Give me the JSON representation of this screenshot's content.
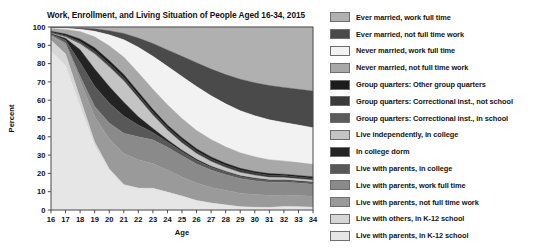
{
  "chart_data": {
    "type": "area",
    "title": "Work, Enrollment, and Living Situation of People Aged 16-34, 2015",
    "xlabel": "Age",
    "ylabel": "Percent",
    "xlim": [
      16,
      34
    ],
    "ylim": [
      0,
      100
    ],
    "grid": false,
    "legend_position": "right",
    "stacked": true,
    "stack_order": "top-to-bottom",
    "categories": [
      16,
      17,
      18,
      19,
      20,
      21,
      22,
      23,
      24,
      25,
      26,
      27,
      28,
      29,
      30,
      31,
      32,
      33,
      34
    ],
    "x_tick_labels": [
      "16",
      "17",
      "18",
      "19",
      "20",
      "21",
      "22",
      "23",
      "24",
      "25",
      "26",
      "27",
      "28",
      "29",
      "30",
      "31",
      "32",
      "33",
      "34"
    ],
    "y_tick_labels": [
      "0",
      "10",
      "20",
      "30",
      "40",
      "50",
      "60",
      "70",
      "80",
      "90",
      "100"
    ],
    "series": [
      {
        "name": "Ever married, work full time",
        "color": "#b0b0b0",
        "values": [
          0.2,
          0.3,
          0.5,
          1.0,
          2.0,
          3.5,
          6.0,
          9.0,
          12.5,
          16.0,
          19.5,
          23.0,
          26.0,
          28.5,
          30.5,
          32.0,
          33.0,
          34.0,
          35.0
        ]
      },
      {
        "name": "Ever married, not full time work",
        "color": "#4a4a4a",
        "values": [
          0.3,
          0.4,
          0.7,
          1.3,
          2.3,
          3.4,
          5.0,
          7.0,
          9.0,
          11.0,
          13.0,
          14.5,
          16.0,
          17.2,
          18.0,
          18.7,
          19.2,
          19.6,
          20.0
        ]
      },
      {
        "name": "Never married, work full time",
        "color": "#f2f2f2",
        "values": [
          0.3,
          0.6,
          1.3,
          3.0,
          6.0,
          9.5,
          14.0,
          18.0,
          21.0,
          23.0,
          24.0,
          24.0,
          23.5,
          23.0,
          22.5,
          21.8,
          21.0,
          20.5,
          20.0
        ]
      },
      {
        "name": "Never married, not full time work",
        "color": "#a8a8a8",
        "values": [
          1.5,
          2.5,
          4.0,
          6.0,
          8.0,
          9.5,
          10.5,
          11.0,
          11.0,
          10.5,
          10.0,
          9.5,
          9.0,
          8.5,
          8.0,
          7.6,
          7.2,
          7.0,
          6.8
        ]
      },
      {
        "name": "Group quarters: Other group quarters",
        "color": "#1c1c1c",
        "values": [
          0.5,
          0.8,
          1.4,
          1.8,
          1.8,
          1.7,
          1.6,
          1.5,
          1.4,
          1.3,
          1.2,
          1.1,
          1.0,
          1.0,
          0.9,
          0.9,
          0.8,
          0.8,
          0.8
        ]
      },
      {
        "name": "Group quarters: Correctional inst., not school",
        "color": "#3a3a3a",
        "values": [
          0.3,
          0.5,
          0.9,
          1.2,
          1.4,
          1.5,
          1.5,
          1.5,
          1.4,
          1.4,
          1.3,
          1.3,
          1.2,
          1.2,
          1.1,
          1.1,
          1.0,
          1.0,
          1.0
        ]
      },
      {
        "name": "Group quarters: Correctional inst., in school",
        "color": "#5c5c5c",
        "values": [
          0.4,
          0.5,
          0.6,
          0.6,
          0.5,
          0.5,
          0.4,
          0.4,
          0.3,
          0.3,
          0.3,
          0.2,
          0.2,
          0.2,
          0.2,
          0.2,
          0.2,
          0.2,
          0.2
        ]
      },
      {
        "name": "Live independently, in college",
        "color": "#c4c4c4",
        "values": [
          0.2,
          0.6,
          3.0,
          8.0,
          10.5,
          11.5,
          10.0,
          7.0,
          5.0,
          3.8,
          3.0,
          2.5,
          2.0,
          1.7,
          1.5,
          1.3,
          1.2,
          1.1,
          1.0
        ]
      },
      {
        "name": "In college dorm",
        "color": "#232323",
        "values": [
          0.2,
          1.0,
          7.0,
          9.5,
          9.0,
          7.5,
          4.5,
          2.2,
          1.3,
          0.9,
          0.7,
          0.6,
          0.5,
          0.4,
          0.4,
          0.3,
          0.3,
          0.3,
          0.3
        ]
      },
      {
        "name": "Live with parents, in college",
        "color": "#585858",
        "values": [
          0.5,
          1.5,
          7.5,
          11.0,
          11.0,
          9.5,
          6.5,
          4.0,
          2.8,
          2.2,
          1.8,
          1.5,
          1.3,
          1.1,
          1.0,
          0.9,
          0.9,
          0.8,
          0.8
        ]
      },
      {
        "name": "Live with parents, work full time",
        "color": "#8a8a8a",
        "values": [
          0.4,
          1.0,
          2.5,
          5.5,
          8.5,
          11.0,
          12.5,
          13.0,
          12.5,
          11.5,
          10.5,
          9.5,
          8.5,
          8.0,
          7.5,
          7.2,
          7.0,
          6.8,
          6.6
        ]
      },
      {
        "name": "Live with parents, not full time work",
        "color": "#9a9a9a",
        "values": [
          2.5,
          5.0,
          9.5,
          14.0,
          16.5,
          17.0,
          15.5,
          13.5,
          12.0,
          10.5,
          9.5,
          8.5,
          8.0,
          7.4,
          7.0,
          6.6,
          6.3,
          6.1,
          6.0
        ]
      },
      {
        "name": "Live with others, in K-12 school",
        "color": "#d6d6d6",
        "values": [
          6.0,
          6.5,
          4.5,
          2.0,
          0.8,
          0.4,
          0.3,
          0.2,
          0.2,
          0.1,
          0.1,
          0.1,
          0.1,
          0.1,
          0.1,
          0.1,
          0.1,
          0.1,
          0.1
        ]
      },
      {
        "name": "Live with parents, in K-12 school",
        "color": "#e6e6e6",
        "values": [
          86.7,
          78.8,
          56.6,
          35.1,
          21.7,
          13.5,
          11.7,
          11.7,
          9.6,
          7.5,
          5.1,
          3.7,
          2.7,
          1.7,
          1.4,
          1.3,
          1.8,
          1.7,
          1.4
        ]
      }
    ]
  },
  "axes": {
    "y_title": "Percent",
    "x_title": "Age"
  }
}
